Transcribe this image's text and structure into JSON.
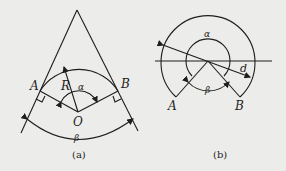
{
  "figure_a": {
    "caption": "(a)",
    "labels": {
      "A": "A",
      "B": "B",
      "O": "O",
      "R": "R",
      "alpha": "α",
      "beta": "β"
    }
  },
  "figure_b": {
    "caption": "(b)",
    "labels": {
      "A": "A",
      "B": "B",
      "alpha": "α",
      "beta": "β",
      "d": "d"
    }
  },
  "colors": {
    "background": "#ececea",
    "stroke": "#1e1e1e"
  }
}
